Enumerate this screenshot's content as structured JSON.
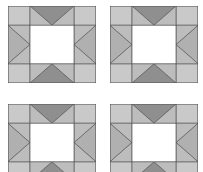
{
  "figure": {
    "type": "geometric-pattern",
    "background_color": "#ffffff",
    "grid": {
      "rows": 2,
      "columns": 4,
      "total_blocks": 4,
      "bottom_row_cropped": true
    },
    "block": {
      "name": "star-in-square quilt block",
      "width_px": 88,
      "height_px": 77,
      "outline_color": "#555555",
      "outline_width_px": 0.8,
      "center_square": {
        "name": "center-white-square",
        "fill": "#ffffff",
        "x_fraction": 0.25,
        "y_fraction": 0.25,
        "width_fraction": 0.5,
        "height_fraction": 0.5
      },
      "pieces": [
        {
          "name": "corner-triangle-top-left",
          "fill": "#c9c9c9",
          "role": "corner"
        },
        {
          "name": "corner-triangle-top-right",
          "fill": "#c9c9c9",
          "role": "corner"
        },
        {
          "name": "corner-triangle-bottom-left",
          "fill": "#c9c9c9",
          "role": "corner"
        },
        {
          "name": "corner-triangle-bottom-right",
          "fill": "#c9c9c9",
          "role": "corner"
        },
        {
          "name": "edge-triangle-top",
          "fill": "#8f8f8f",
          "role": "edge-accent"
        },
        {
          "name": "edge-triangle-bottom",
          "fill": "#8f8f8f",
          "role": "edge-accent"
        },
        {
          "name": "edge-triangle-left",
          "fill": "#b0b0b0",
          "role": "edge"
        },
        {
          "name": "edge-triangle-right",
          "fill": "#b0b0b0",
          "role": "edge"
        },
        {
          "name": "inner-wedge-top-left",
          "fill": "#bdbdbd",
          "role": "inner-wedge"
        },
        {
          "name": "inner-wedge-top-right",
          "fill": "#bdbdbd",
          "role": "inner-wedge"
        },
        {
          "name": "inner-wedge-bottom-left",
          "fill": "#bdbdbd",
          "role": "inner-wedge"
        },
        {
          "name": "inner-wedge-bottom-right",
          "fill": "#bdbdbd",
          "role": "inner-wedge"
        }
      ]
    },
    "palette": {
      "light_gray": "#c9c9c9",
      "mid_gray": "#b0b0b0",
      "wedge_gray": "#bdbdbd",
      "dark_gray": "#8f8f8f",
      "white": "#ffffff",
      "line": "#555555"
    },
    "blocks": [
      {
        "name": "quilt-block-top-left",
        "row": 1,
        "column": 1,
        "x": 8,
        "y": 6,
        "cropped": false
      },
      {
        "name": "quilt-block-top-right",
        "row": 1,
        "column": 2,
        "x": 110,
        "y": 6,
        "cropped": false
      },
      {
        "name": "quilt-block-bottom-left",
        "row": 2,
        "column": 1,
        "x": 8,
        "y": 104,
        "cropped": true
      },
      {
        "name": "quilt-block-bottom-right",
        "row": 2,
        "column": 2,
        "x": 110,
        "y": 104,
        "cropped": true
      }
    ]
  }
}
